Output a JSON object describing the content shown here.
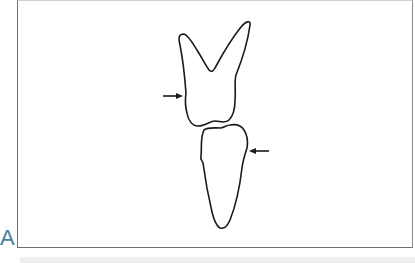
{
  "figure": {
    "panel_label": "A",
    "panel_label_color": "#4a7d9c",
    "line_color": "#1a1a1a",
    "frame_color": "#6e6e6e",
    "elements": [
      {
        "name": "upper-tooth",
        "description": "two-rooted tooth outline (roots pointing up)"
      },
      {
        "name": "lower-tooth",
        "description": "single-rooted tooth outline (root pointing down)"
      },
      {
        "name": "arrow-left",
        "direction": "right",
        "points_to": "upper-tooth"
      },
      {
        "name": "arrow-right",
        "direction": "left",
        "points_to": "lower-tooth"
      }
    ]
  }
}
